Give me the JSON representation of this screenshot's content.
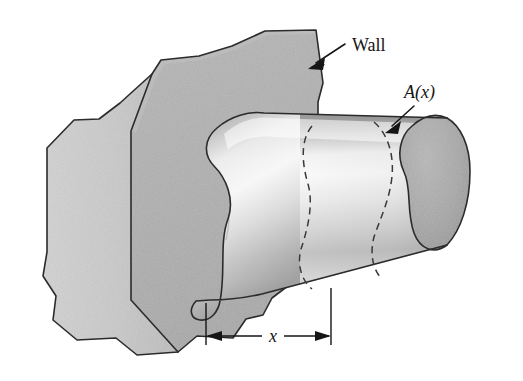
{
  "figure": {
    "kind": "engineering-diagram",
    "background_color": "#ffffff",
    "width": 523,
    "height": 381
  },
  "labels": {
    "wall": "Wall",
    "area_function": "A(x)",
    "distance": "x"
  },
  "annotations": {
    "wall_leader": {
      "name": "wall-leader-arrow",
      "from_x": 345,
      "from_y": 44,
      "to_x": 311,
      "to_y": 66
    },
    "area_leader": {
      "name": "area-leader-arrow",
      "from_x": 415,
      "from_y": 105,
      "to_x": 388,
      "to_y": 131
    },
    "dimension": {
      "name": "x-dimension",
      "left_x": 206,
      "right_x": 331,
      "baseline_y": 336,
      "ext_top_left_y": 303,
      "ext_top_right_y": 288
    }
  },
  "colors": {
    "wall_front_face": "#b4b4b4",
    "wall_side_face": "#c9c9c9",
    "wall_top_face": "#a8a8a8",
    "beam_highlight": "#f0f0f0",
    "beam_midtone": "#c4c4c4",
    "beam_shadow": "#9a9a9a",
    "beam_endcap": "#a6a6a6",
    "outline": "#2b2b2b",
    "label_text": "#151515",
    "hidden_line": "#3a3a3a"
  },
  "geometry": {
    "wall_outline": "M 48,147 L 48,276 L 57,300 L 55,322 L 78,341 L 118,340 L 138,355 L 178,353 L 196,337 L 232,339 L 246,320 L 262,316 L 272,299 L 318,264 L 318,103 L 322,84 L 316,30 L 266,31 L 232,47 L 200,56 L 162,60 L 152,75 L 120,105 L 100,120 L 76,121 Z",
    "wall_left_face": "M 48,147 L 48,276 L 57,300 L 55,322 L 78,341 L 118,340 L 138,355 L 178,353 L 130,300 L 130,134 L 152,75 L 120,105 L 100,120 L 76,121 Z",
    "wall_front_face": "M 130,134 L 130,300 L 178,353 L 196,337 L 232,339 L 246,320 L 262,316 L 272,299 L 318,264 L 318,103 L 322,84 L 316,30 L 266,31 L 232,47 L 200,56 L 162,60 L 152,75 Z",
    "beam_body": "M 194,300 C 188,308 190,316 198,318 C 208,320 215,313 217,303 C 222,281 218,248 226,224 C 232,205 224,180 212,167 C 200,155 200,140 214,128 C 226,118 244,113 258,115 L 448,120 C 462,128 470,146 470,170 C 470,202 462,228 448,243 L 260,292 C 242,296 220,298 208,298 Z",
    "beam_endcap": "M 448,120 C 462,128 470,146 470,170 C 470,202 462,228 448,243 C 432,252 418,246 412,230 C 404,209 410,186 402,170 C 394,154 398,136 410,126 C 420,118 436,114 448,120 Z",
    "hidden_curve_left": "M 308,129 C 298,142 300,166 306,186 C 312,206 306,230 300,248 C 296,262 300,278 310,287",
    "hidden_curve_right": "M 372,124 C 386,136 392,156 390,176 C 388,198 378,218 372,236 C 368,250 370,266 378,276"
  },
  "interaction": {
    "is_static_figure": true
  }
}
